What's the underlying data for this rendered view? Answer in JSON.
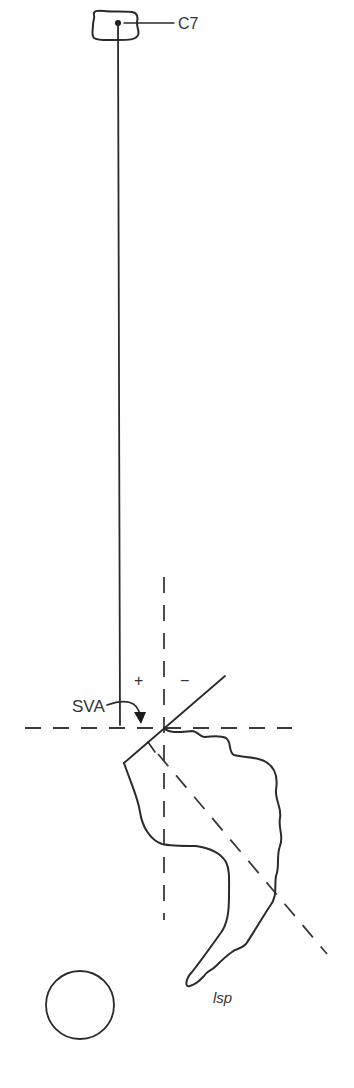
{
  "diagram": {
    "colors": {
      "line": "#2b2b2b",
      "background": "#ffffff"
    },
    "labels": {
      "c7": "C7",
      "sva": "SVA",
      "plus": "+",
      "minus": "−",
      "sacrum": "lsp"
    },
    "elements": [
      {
        "name": "c7-vertebra",
        "description": "C7 vertebral body with centroid dot"
      },
      {
        "name": "c7-plumb-line",
        "description": "vertical plumb line from C7 centroid"
      },
      {
        "name": "vertical-reference-dashed",
        "description": "vertical dashed line through posterosuperior S1 corner"
      },
      {
        "name": "horizontal-reference-dashed",
        "description": "horizontal dashed line at S1 posterosuperior corner"
      },
      {
        "name": "sacral-endplate-line",
        "description": "solid line along sacral endplate"
      },
      {
        "name": "sacral-perpendicular-dashed",
        "description": "dashed line perpendicular to endplate"
      },
      {
        "name": "sacrum-outline",
        "description": "sacrum and coccyx outline"
      },
      {
        "name": "femoral-head-circle",
        "description": "femoral head"
      }
    ]
  }
}
